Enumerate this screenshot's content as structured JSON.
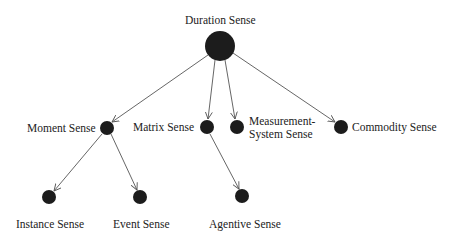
{
  "colors": {
    "node": "#1c1c1c",
    "edge": "#555555",
    "text": "#222222"
  },
  "nodes": [
    {
      "id": "duration",
      "label": "Duration Sense",
      "cx": 220,
      "cy": 46,
      "r": 15
    },
    {
      "id": "moment",
      "label": "Moment Sense",
      "cx": 107,
      "cy": 128,
      "r": 7
    },
    {
      "id": "matrix",
      "label": "Matrix Sense",
      "cx": 207,
      "cy": 127,
      "r": 7
    },
    {
      "id": "measurement",
      "label_line1": "Measurement-",
      "label_line2": "System Sense",
      "cx": 237,
      "cy": 127,
      "r": 7
    },
    {
      "id": "commodity",
      "label": "Commodity Sense",
      "cx": 341,
      "cy": 127,
      "r": 7
    },
    {
      "id": "instance",
      "label": "Instance Sense",
      "cx": 49,
      "cy": 197,
      "r": 7
    },
    {
      "id": "event",
      "label": "Event Sense",
      "cx": 140,
      "cy": 197,
      "r": 7
    },
    {
      "id": "agentive",
      "label": "Agentive Sense",
      "cx": 242,
      "cy": 196,
      "r": 7
    }
  ],
  "edges": [
    {
      "from": "duration",
      "to": "moment"
    },
    {
      "from": "duration",
      "to": "matrix"
    },
    {
      "from": "duration",
      "to": "measurement"
    },
    {
      "from": "duration",
      "to": "commodity"
    },
    {
      "from": "moment",
      "to": "instance"
    },
    {
      "from": "moment",
      "to": "event"
    },
    {
      "from": "matrix",
      "to": "agentive"
    }
  ]
}
